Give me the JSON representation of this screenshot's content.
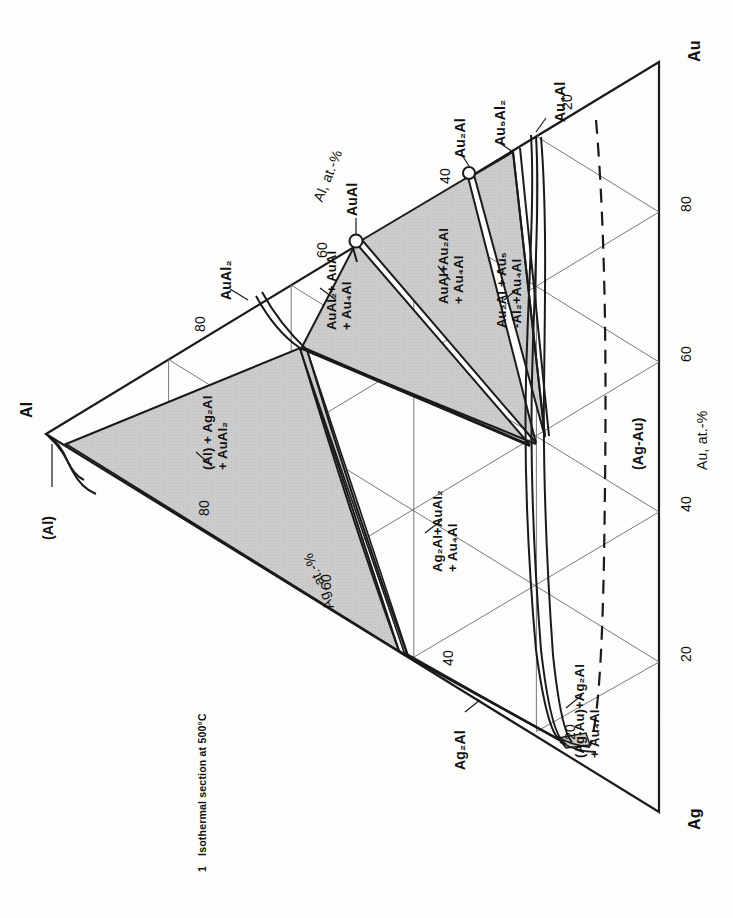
{
  "figure": {
    "caption_number": "1",
    "caption_text": "Isothermal section at 500°C",
    "system": "Ag-Al-Au",
    "orientation": "rotated 90° clockwise (triangle apex Al at left)"
  },
  "corners": [
    {
      "name": "corner-al",
      "label": "Al"
    },
    {
      "name": "corner-au",
      "label": "Au"
    },
    {
      "name": "corner-ag",
      "label": "Ag"
    }
  ],
  "axes": [
    {
      "name": "axis-al",
      "title": "Al, at.-%",
      "ticks": [
        "80",
        "60",
        "40",
        "20"
      ]
    },
    {
      "name": "axis-au",
      "title": "Au, at.-%",
      "ticks": [
        "80",
        "60",
        "40",
        "20"
      ]
    },
    {
      "name": "axis-ag",
      "title": "Ag, at.-%",
      "ticks": [
        "80",
        "60",
        "40",
        "20"
      ]
    }
  ],
  "tick_labels": {
    "al_80": "80",
    "al_60": "60",
    "al_40": "40",
    "al_20": "20",
    "au_80": "80",
    "au_60": "60",
    "au_40": "40",
    "au_20": "20",
    "ag_80": "80",
    "ag_60": "60",
    "ag_40": "40",
    "ag_20": "20"
  },
  "compounds": [
    {
      "name": "compound-aual2",
      "label": "AuAl",
      "sub": "2",
      "note": "binary Al-Au compound"
    },
    {
      "name": "compound-aual",
      "label": "AuAl",
      "sub": "",
      "note": "binary Al-Au compound"
    },
    {
      "name": "compound-au2al",
      "label": "Au",
      "sub": "2",
      "tail": "Al"
    },
    {
      "name": "compound-au5al2",
      "label": "Au",
      "sub": "5",
      "tail": "Al",
      "sub2": "2"
    },
    {
      "name": "compound-au4al",
      "label": "Au",
      "sub": "4",
      "tail": "Al"
    },
    {
      "name": "compound-ag2al",
      "label": "Ag",
      "sub": "2",
      "tail": "Al"
    },
    {
      "name": "compound-al-terminal",
      "label": "(Al)"
    },
    {
      "name": "compound-agau-solid-solution",
      "label": "(Ag-Au)"
    }
  ],
  "compound_labels": {
    "aual2": "AuAl₂",
    "aual": "AuAl",
    "au2al": "Au₂Al",
    "au5al2": "Au₅Al₂",
    "au4al": "Au₄Al",
    "ag2al": "Ag₂Al",
    "al_terminal": "(Al)",
    "agau": "(Ag-Au)"
  },
  "phase_fields": [
    {
      "name": "field-al-ag2al-aual2",
      "lines": [
        "(Al) + Ag₂Al",
        "+ AuAl₂"
      ],
      "shaded": true
    },
    {
      "name": "field-aual2-aual-au4al",
      "lines": [
        "AuAl₂+ AuAl",
        "+ Au₄Al"
      ],
      "shaded": true
    },
    {
      "name": "field-aual-au2al-au4al",
      "lines": [
        "AuAl+Au₂Al",
        "+ Au₄Al"
      ],
      "shaded": true
    },
    {
      "name": "field-au2al-au5al2-au4al",
      "lines": [
        "Au₂Al + Au₅",
        "-Al₂+Au₄Al"
      ],
      "shaded": true
    },
    {
      "name": "field-ag2al-aual2-au4al",
      "lines": [
        "Ag₂Al+AuAl₂",
        "+ Au₄Al"
      ],
      "shaded": false
    },
    {
      "name": "field-agau-ag2al-au4al",
      "lines": [
        "(Ag-Au)+Ag₂Al",
        "+ Au₄Al"
      ],
      "shaded": false
    },
    {
      "name": "field-agau",
      "lines": [
        "(Ag-Au)"
      ],
      "shaded": false
    }
  ],
  "colors": {
    "line": "#1a1a1a",
    "grid": "#555555",
    "shade": "#c9c9c9",
    "background": "#fdfdfb",
    "text": "#111111"
  }
}
